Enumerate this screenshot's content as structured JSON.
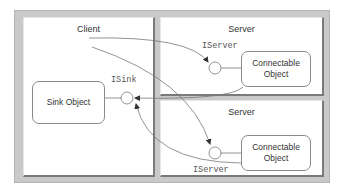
{
  "diagram": {
    "client": {
      "title": "Client",
      "sink_object": "Sink Object",
      "sink_interface": "ISink"
    },
    "servers": [
      {
        "title": "Server",
        "object_label_line1": "Connectable",
        "object_label_line2": "Object",
        "interface": "IServer"
      },
      {
        "title": "Server",
        "object_label_line1": "Connectable",
        "object_label_line2": "Object",
        "interface": "IServer"
      }
    ],
    "colors": {
      "frame": "#c9c9c9",
      "panel": "#ffffff",
      "line": "#666666",
      "text": "#333333"
    }
  }
}
